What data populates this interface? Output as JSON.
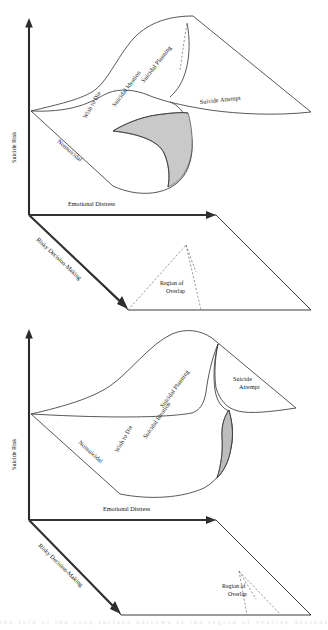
{
  "figure": {
    "shading_color": "#c9c9c9",
    "line_color": "#3a3a3a",
    "axis_color": "#2b2b2b",
    "background": "#ffffff",
    "cropped_caption": "the fold of the cusp surface narrows as the region of overlap decreases"
  },
  "panels": [
    {
      "id": "panel-top",
      "name": "top-panel",
      "axes": {
        "y_label": "Suicide Risk",
        "x_label": "Emotional Distress",
        "z_label": "Risky Decision-Making"
      },
      "surface_regions": [
        "Nonsuicidal",
        "Wish to Die",
        "Suicidal Ideation",
        "Suicidal Planning",
        "Suicide Attempt"
      ],
      "control_plane": {
        "annotation": "Region of Overlap",
        "overlap_width": "wide"
      },
      "fold_shading": "large"
    },
    {
      "id": "panel-bottom",
      "name": "bottom-panel",
      "axes": {
        "y_label": "Suicide Risk",
        "x_label": "Emotional Distress",
        "z_label": "Risky Decision-Making"
      },
      "surface_regions": [
        "Nonsuicidal",
        "Wish to Die",
        "Suicidal Ideation",
        "Suicidal Planning",
        "Suicide Attempt"
      ],
      "control_plane": {
        "annotation": "Region of Overlap",
        "overlap_width": "narrow"
      },
      "fold_shading": "small"
    }
  ],
  "chart_data": {
    "type": "diagram",
    "subtype": "cusp-catastrophe-surface",
    "panel_count": 2,
    "axes": {
      "vertical": "Suicide Risk",
      "horizontal": "Emotional Distress",
      "depth": "Risky Decision-Making"
    },
    "surface_bands_low_to_high": [
      "Nonsuicidal",
      "Wish to Die",
      "Suicidal Ideation",
      "Suicidal Planning",
      "Suicide Attempt"
    ],
    "control_plane_annotation": "Region of Overlap",
    "panel_difference": "Top panel shows a large fold (shaded) and a wide region of overlap; bottom panel shows a narrow fold sliver and a narrow region of overlap."
  }
}
